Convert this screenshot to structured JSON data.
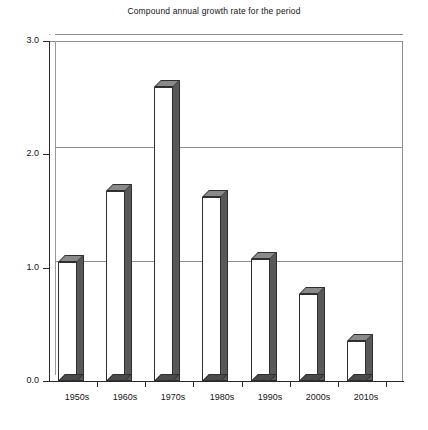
{
  "chart_data": {
    "type": "bar",
    "title": "Compound annual growth rate for the period",
    "xlabel": "",
    "ylabel": "",
    "categories": [
      "1950s",
      "1960s",
      "1970s",
      "1980s",
      "1990s",
      "2000s",
      "2010s"
    ],
    "values": [
      1.05,
      1.68,
      2.59,
      1.62,
      1.08,
      0.77,
      0.35
    ],
    "ylim": [
      0.0,
      3.0
    ],
    "yticks": [
      "0.0",
      "1.0",
      "2.0",
      "3.0"
    ],
    "ytick_values": [
      0.0,
      1.0,
      2.0,
      3.0
    ],
    "grid": true,
    "legend": null,
    "style": "3d-bar",
    "colors": {
      "bar_front": "#ffffff",
      "bar_side": "#585858",
      "bar_top": "#8a8a8a",
      "bar_base": "#4a4a4a",
      "outline": "#2f2f2f",
      "gridline": "#8d8d8d",
      "axis": "#2a2a2a",
      "text": "#141414",
      "background": "#ffffff"
    }
  }
}
